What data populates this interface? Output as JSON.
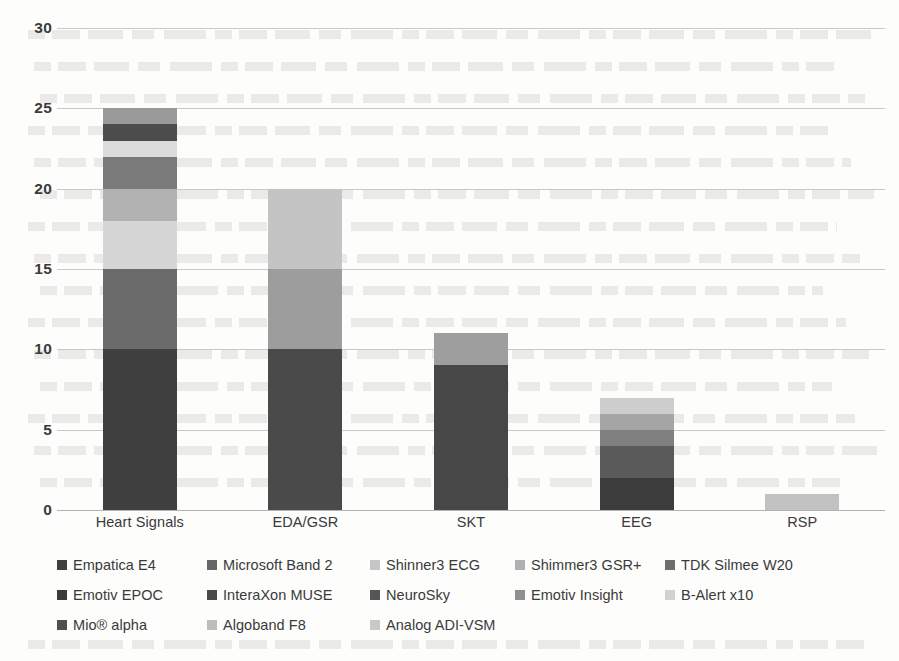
{
  "chart_data": {
    "type": "bar",
    "subtype": "stacked-bar",
    "title": "",
    "xlabel": "",
    "ylabel": "",
    "ylim": [
      0,
      30
    ],
    "ytick_labels": [
      "0",
      "5",
      "10",
      "15",
      "20",
      "25",
      "30"
    ],
    "ytick_values": [
      0,
      5,
      10,
      15,
      20,
      25,
      30
    ],
    "grid": true,
    "legend_position": "bottom",
    "categories": [
      "Heart Signals",
      "EDA/GSR",
      "SKT",
      "EEG",
      "RSP"
    ],
    "category_totals": [
      25,
      20,
      11,
      7,
      1
    ],
    "series": [
      {
        "name": "Empatica E4",
        "color": "#3f3f3f",
        "values": [
          10,
          10,
          9,
          2,
          0
        ]
      },
      {
        "name": "Microsoft Band 2",
        "color": "#676767",
        "values": [
          5,
          5,
          0,
          2,
          0
        ]
      },
      {
        "name": "Shinner3  ECG",
        "color": "#c6c6c6",
        "values": [
          3,
          5,
          0,
          0,
          0
        ]
      },
      {
        "name": "Shimmer3 GSR+",
        "color": "#b0b0b0",
        "values": [
          2,
          0,
          2,
          1,
          0
        ]
      },
      {
        "name": "TDK Silmee W20",
        "color": "#6e6e6e",
        "values": [
          2,
          0,
          0,
          0,
          0
        ]
      },
      {
        "name": "Emotiv EPOC",
        "color": "#3a3a3a",
        "values": [
          0,
          0,
          0,
          0,
          0
        ]
      },
      {
        "name": "InteraXon MUSE",
        "color": "#4a4a4a",
        "values": [
          0,
          0,
          0,
          0,
          0
        ]
      },
      {
        "name": "NeuroSky",
        "color": "#565656",
        "values": [
          0,
          0,
          0,
          0,
          0
        ]
      },
      {
        "name": "Emotiv Insight",
        "color": "#8f8f8f",
        "values": [
          0,
          0,
          0,
          1,
          0
        ]
      },
      {
        "name": "B-Alert x10",
        "color": "#d2d2d2",
        "values": [
          1,
          0,
          0,
          0,
          0
        ]
      },
      {
        "name": "Mio® alpha",
        "color": "#4f4f4f",
        "values": [
          1,
          0,
          0,
          0,
          0
        ]
      },
      {
        "name": "Algoband F8",
        "color": "#bdbdbd",
        "values": [
          0,
          0,
          0,
          1,
          0
        ]
      },
      {
        "name": "Analog ADI-VSM",
        "color": "#c9c9c9",
        "values": [
          1,
          0,
          0,
          0,
          1
        ]
      }
    ],
    "stacks": [
      {
        "category": "Heart Signals",
        "total": 25,
        "segments": [
          {
            "series": "Empatica E4",
            "value": 10,
            "color": "#3f3f3f"
          },
          {
            "series": "Microsoft Band 2",
            "value": 5,
            "color": "#6b6b6b"
          },
          {
            "series": "Shinner3  ECG",
            "value": 3,
            "color": "#d6d6d6"
          },
          {
            "series": "Shimmer3 GSR+",
            "value": 2,
            "color": "#b2b2b2"
          },
          {
            "series": "TDK Silmee W20",
            "value": 2,
            "color": "#7a7a7a"
          },
          {
            "series": "B-Alert x10",
            "value": 1,
            "color": "#dcdcdc"
          },
          {
            "series": "Mio® alpha",
            "value": 1,
            "color": "#4c4c4c"
          },
          {
            "series": "Analog ADI-VSM",
            "value": 1,
            "color": "#9a9a9a"
          }
        ]
      },
      {
        "category": "EDA/GSR",
        "total": 20,
        "segments": [
          {
            "series": "Empatica E4",
            "value": 10,
            "color": "#4a4a4a"
          },
          {
            "series": "Microsoft Band 2",
            "value": 5,
            "color": "#9d9d9d"
          },
          {
            "series": "Shinner3  ECG",
            "value": 5,
            "color": "#c4c4c4"
          }
        ]
      },
      {
        "category": "SKT",
        "total": 11,
        "segments": [
          {
            "series": "Empatica E4",
            "value": 9,
            "color": "#474747"
          },
          {
            "series": "Shimmer3 GSR+",
            "value": 2,
            "color": "#9e9e9e"
          }
        ]
      },
      {
        "category": "EEG",
        "total": 7,
        "segments": [
          {
            "series": "Empatica E4",
            "value": 2,
            "color": "#3c3c3c"
          },
          {
            "series": "Microsoft Band 2",
            "value": 2,
            "color": "#5a5a5a"
          },
          {
            "series": "Shimmer3 GSR+",
            "value": 1,
            "color": "#808080"
          },
          {
            "series": "Emotiv Insight",
            "value": 1,
            "color": "#a5a5a5"
          },
          {
            "series": "Algoband F8",
            "value": 1,
            "color": "#cdcdcd"
          }
        ]
      },
      {
        "category": "RSP",
        "total": 1,
        "segments": [
          {
            "series": "Analog ADI-VSM",
            "value": 1,
            "color": "#c2c2c2"
          }
        ]
      }
    ]
  },
  "legend": {
    "rows": [
      [
        {
          "label": "Empatica E4",
          "color": "#3f3f3f",
          "width": 150
        },
        {
          "label": "Microsoft Band 2",
          "color": "#676767",
          "width": 163
        },
        {
          "label": "Shinner3  ECG",
          "color": "#c6c6c6",
          "width": 145
        },
        {
          "label": "Shimmer3 GSR+",
          "color": "#b0b0b0",
          "width": 150
        },
        {
          "label": "TDK Silmee W20",
          "color": "#6e6e6e",
          "width": 150
        }
      ],
      [
        {
          "label": "Emotiv EPOC",
          "color": "#3a3a3a",
          "width": 150
        },
        {
          "label": "InteraXon MUSE",
          "color": "#4a4a4a",
          "width": 163
        },
        {
          "label": "NeuroSky",
          "color": "#565656",
          "width": 145
        },
        {
          "label": "Emotiv Insight",
          "color": "#8f8f8f",
          "width": 150
        },
        {
          "label": "B-Alert x10",
          "color": "#d2d2d2",
          "width": 150
        }
      ],
      [
        {
          "label": "Mio® alpha",
          "color": "#4f4f4f",
          "width": 150
        },
        {
          "label": "Algoband F8",
          "color": "#bdbdbd",
          "width": 163
        },
        {
          "label": "Analog ADI-VSM",
          "color": "#c9c9c9",
          "width": 145
        }
      ]
    ]
  }
}
